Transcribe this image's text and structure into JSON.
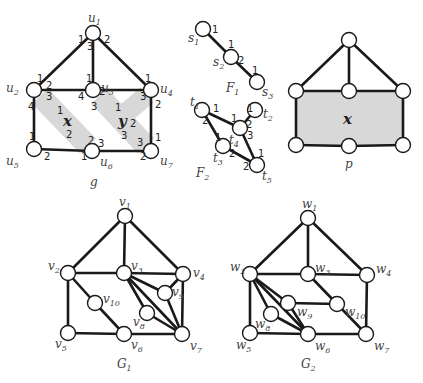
{
  "figure": {
    "graph_g": {
      "caption": "g",
      "nodes": [
        {
          "id": "u1",
          "label": "u",
          "sub": "1",
          "x": 93,
          "y": 33,
          "lx": 88,
          "ly": 22
        },
        {
          "id": "u2",
          "label": "u",
          "sub": "2",
          "x": 34,
          "y": 90,
          "lx": 6,
          "ly": 92
        },
        {
          "id": "u3",
          "label": "u",
          "sub": "3",
          "x": 93,
          "y": 90,
          "lx": 101,
          "ly": 92
        },
        {
          "id": "u4",
          "label": "u",
          "sub": "4",
          "x": 151,
          "y": 90,
          "lx": 160,
          "ly": 93
        },
        {
          "id": "u5",
          "label": "u",
          "sub": "5",
          "x": 34,
          "y": 149,
          "lx": 6,
          "ly": 165
        },
        {
          "id": "u6",
          "label": "u",
          "sub": "6",
          "x": 92,
          "y": 151,
          "lx": 100,
          "ly": 166
        },
        {
          "id": "u7",
          "label": "u",
          "sub": "7",
          "x": 151,
          "y": 151,
          "lx": 160,
          "ly": 165
        }
      ],
      "edges": [
        [
          "u1",
          "u2"
        ],
        [
          "u1",
          "u3"
        ],
        [
          "u1",
          "u4"
        ],
        [
          "u2",
          "u3"
        ],
        [
          "u3",
          "u4"
        ],
        [
          "u2",
          "u5"
        ],
        [
          "u4",
          "u7"
        ],
        [
          "u5",
          "u6"
        ],
        [
          "u6",
          "u7"
        ]
      ],
      "faces": [
        {
          "name": "x",
          "x": 63,
          "y": 126
        },
        {
          "name": "y",
          "x": 118,
          "y": 126
        }
      ],
      "ports": [
        {
          "t": "1",
          "x": 78,
          "y": 43
        },
        {
          "t": "2",
          "x": 104,
          "y": 43
        },
        {
          "t": "3",
          "x": 87,
          "y": 50
        },
        {
          "t": "1",
          "x": 37,
          "y": 82
        },
        {
          "t": "2",
          "x": 46,
          "y": 89
        },
        {
          "t": "3",
          "x": 46,
          "y": 100
        },
        {
          "t": "4",
          "x": 28,
          "y": 110
        },
        {
          "t": "1",
          "x": 86,
          "y": 82
        },
        {
          "t": "2",
          "x": 99,
          "y": 95
        },
        {
          "t": "4",
          "x": 78,
          "y": 100
        },
        {
          "t": "3",
          "x": 91,
          "y": 110
        },
        {
          "t": "1",
          "x": 145,
          "y": 82
        },
        {
          "t": "3",
          "x": 140,
          "y": 100
        },
        {
          "t": "2",
          "x": 155,
          "y": 108
        },
        {
          "t": "1",
          "x": 29,
          "y": 140
        },
        {
          "t": "2",
          "x": 44,
          "y": 160
        },
        {
          "t": "2",
          "x": 88,
          "y": 144
        },
        {
          "t": "3",
          "x": 98,
          "y": 147
        },
        {
          "t": "1",
          "x": 81,
          "y": 160
        },
        {
          "t": "1",
          "x": 155,
          "y": 141
        },
        {
          "t": "3",
          "x": 137,
          "y": 146
        },
        {
          "t": "2",
          "x": 140,
          "y": 160
        },
        {
          "t": "1",
          "x": 57,
          "y": 114
        },
        {
          "t": "2",
          "x": 66,
          "y": 138
        },
        {
          "t": "1",
          "x": 115,
          "y": 111
        },
        {
          "t": "2",
          "x": 130,
          "y": 127
        },
        {
          "t": "3",
          "x": 121,
          "y": 139
        }
      ]
    },
    "graph_F1": {
      "caption": "F",
      "caption_sub": "1",
      "nodes": [
        {
          "id": "s1",
          "label": "s",
          "sub": "1",
          "x": 203,
          "y": 29,
          "lx": 188,
          "ly": 42
        },
        {
          "id": "s2",
          "label": "s",
          "sub": "2",
          "x": 231,
          "y": 57,
          "lx": 213,
          "ly": 66
        },
        {
          "id": "s3",
          "label": "s",
          "sub": "3",
          "x": 257,
          "y": 82,
          "lx": 262,
          "ly": 96
        }
      ],
      "edges": [
        [
          "s1",
          "s2"
        ],
        [
          "s2",
          "s3"
        ]
      ],
      "ports": [
        {
          "t": "1",
          "x": 212,
          "y": 33
        },
        {
          "t": "1",
          "x": 228,
          "y": 48
        },
        {
          "t": "2",
          "x": 238,
          "y": 64
        },
        {
          "t": "1",
          "x": 252,
          "y": 74
        }
      ]
    },
    "graph_F2": {
      "caption": "F",
      "caption_sub": "2",
      "nodes": [
        {
          "id": "t1",
          "label": "t",
          "sub": "1",
          "x": 202,
          "y": 110,
          "lx": 190,
          "ly": 106
        },
        {
          "id": "t2",
          "label": "t",
          "sub": "2",
          "x": 255,
          "y": 110,
          "lx": 263,
          "ly": 118
        },
        {
          "id": "t4",
          "label": "t",
          "sub": "4",
          "x": 240,
          "y": 128,
          "lx": 229,
          "ly": 144
        },
        {
          "id": "t3",
          "label": "t",
          "sub": "3",
          "x": 223,
          "y": 146,
          "lx": 213,
          "ly": 162
        },
        {
          "id": "t5",
          "label": "t",
          "sub": "5",
          "x": 257,
          "y": 165,
          "lx": 262,
          "ly": 180
        }
      ],
      "edges": [
        [
          "t1",
          "t4"
        ],
        [
          "t1",
          "t3"
        ],
        [
          "t4",
          "t2"
        ],
        [
          "t4",
          "t5"
        ],
        [
          "t3",
          "t5"
        ]
      ],
      "ports": [
        {
          "t": "1",
          "x": 213,
          "y": 112
        },
        {
          "t": "2",
          "x": 202,
          "y": 124
        },
        {
          "t": "1",
          "x": 231,
          "y": 122
        },
        {
          "t": "2",
          "x": 246,
          "y": 128
        },
        {
          "t": "3",
          "x": 247,
          "y": 139
        },
        {
          "t": "1",
          "x": 247,
          "y": 112
        },
        {
          "t": "1",
          "x": 215,
          "y": 141
        },
        {
          "t": "2",
          "x": 229,
          "y": 157
        },
        {
          "t": "1",
          "x": 258,
          "y": 157
        },
        {
          "t": "2",
          "x": 243,
          "y": 170
        }
      ]
    },
    "graph_p": {
      "caption": "p",
      "nodes": [
        {
          "id": "p1",
          "x": 349,
          "y": 40
        },
        {
          "id": "p2",
          "x": 296,
          "y": 91
        },
        {
          "id": "p3",
          "x": 349,
          "y": 91
        },
        {
          "id": "p4",
          "x": 403,
          "y": 91
        },
        {
          "id": "p5",
          "x": 296,
          "y": 145
        },
        {
          "id": "p6",
          "x": 349,
          "y": 146
        },
        {
          "id": "p7",
          "x": 403,
          "y": 145
        }
      ],
      "edges": [
        [
          "p1",
          "p2"
        ],
        [
          "p1",
          "p3"
        ],
        [
          "p1",
          "p4"
        ],
        [
          "p2",
          "p3"
        ],
        [
          "p3",
          "p4"
        ],
        [
          "p2",
          "p5"
        ],
        [
          "p4",
          "p7"
        ],
        [
          "p5",
          "p6"
        ],
        [
          "p6",
          "p7"
        ]
      ],
      "face": {
        "name": "x",
        "x": 349,
        "y": 124
      }
    },
    "graph_G1": {
      "caption": "G",
      "caption_sub": "1",
      "nodes": [
        {
          "id": "v1",
          "label": "v",
          "sub": "1",
          "x": 125,
          "y": 216,
          "lx": 119,
          "ly": 206
        },
        {
          "id": "v2",
          "label": "v",
          "sub": "2",
          "x": 68,
          "y": 273,
          "lx": 48,
          "ly": 270
        },
        {
          "id": "v3",
          "label": "v",
          "sub": "3",
          "x": 124,
          "y": 273,
          "lx": 131,
          "ly": 270
        },
        {
          "id": "v4",
          "label": "v",
          "sub": "4",
          "x": 183,
          "y": 274,
          "lx": 193,
          "ly": 277
        },
        {
          "id": "v5",
          "label": "v",
          "sub": "5",
          "x": 68,
          "y": 333,
          "lx": 55,
          "ly": 348
        },
        {
          "id": "v6",
          "label": "v",
          "sub": "6",
          "x": 124,
          "y": 334,
          "lx": 131,
          "ly": 349
        },
        {
          "id": "v7",
          "label": "v",
          "sub": "7",
          "x": 182,
          "y": 334,
          "lx": 190,
          "ly": 350
        },
        {
          "id": "v8",
          "label": "v",
          "sub": "8",
          "x": 147,
          "y": 313,
          "lx": 133,
          "ly": 326
        },
        {
          "id": "v9",
          "label": "v",
          "sub": "9",
          "x": 165,
          "y": 293,
          "lx": 172,
          "ly": 296
        },
        {
          "id": "v10",
          "label": "v",
          "sub": "10",
          "x": 95,
          "y": 303,
          "lx": 103,
          "ly": 303
        }
      ],
      "edges": [
        [
          "v1",
          "v2"
        ],
        [
          "v1",
          "v3"
        ],
        [
          "v1",
          "v4"
        ],
        [
          "v2",
          "v3"
        ],
        [
          "v3",
          "v4"
        ],
        [
          "v2",
          "v5"
        ],
        [
          "v2",
          "v10"
        ],
        [
          "v10",
          "v6"
        ],
        [
          "v5",
          "v6"
        ],
        [
          "v6",
          "v7"
        ],
        [
          "v4",
          "v7"
        ],
        [
          "v3",
          "v9"
        ],
        [
          "v3",
          "v8"
        ],
        [
          "v4",
          "v9"
        ],
        [
          "v9",
          "v7"
        ],
        [
          "v8",
          "v7"
        ],
        [
          "v3",
          "v7"
        ]
      ]
    },
    "graph_G2": {
      "caption": "G",
      "caption_sub": "2",
      "nodes": [
        {
          "id": "w1",
          "label": "w",
          "sub": "1",
          "x": 308,
          "y": 218,
          "lx": 302,
          "ly": 208
        },
        {
          "id": "w2",
          "label": "w",
          "sub": "2",
          "x": 250,
          "y": 274,
          "lx": 230,
          "ly": 271
        },
        {
          "id": "w3",
          "label": "w",
          "sub": "3",
          "x": 308,
          "y": 274,
          "lx": 315,
          "ly": 272
        },
        {
          "id": "w4",
          "label": "w",
          "sub": "4",
          "x": 367,
          "y": 275,
          "lx": 376,
          "ly": 273
        },
        {
          "id": "w5",
          "label": "w",
          "sub": "5",
          "x": 250,
          "y": 333,
          "lx": 236,
          "ly": 349
        },
        {
          "id": "w6",
          "label": "w",
          "sub": "6",
          "x": 308,
          "y": 334,
          "lx": 315,
          "ly": 350
        },
        {
          "id": "w7",
          "label": "w",
          "sub": "7",
          "x": 366,
          "y": 334,
          "lx": 374,
          "ly": 350
        },
        {
          "id": "w8",
          "label": "w",
          "sub": "8",
          "x": 271,
          "y": 314,
          "lx": 255,
          "ly": 328
        },
        {
          "id": "w9",
          "label": "w",
          "sub": "9",
          "x": 288,
          "y": 303,
          "lx": 297,
          "ly": 316
        },
        {
          "id": "w10",
          "label": "w",
          "sub": "10",
          "x": 337,
          "y": 304,
          "lx": 345,
          "ly": 316
        }
      ],
      "edges": [
        [
          "w1",
          "w2"
        ],
        [
          "w1",
          "w3"
        ],
        [
          "w1",
          "w4"
        ],
        [
          "w2",
          "w3"
        ],
        [
          "w3",
          "w4"
        ],
        [
          "w2",
          "w5"
        ],
        [
          "w4",
          "w7"
        ],
        [
          "w5",
          "w6"
        ],
        [
          "w6",
          "w7"
        ],
        [
          "w3",
          "w10"
        ],
        [
          "w10",
          "w7"
        ],
        [
          "w9",
          "w10"
        ],
        [
          "w2",
          "w9"
        ],
        [
          "w2",
          "w8"
        ],
        [
          "w2",
          "w6"
        ],
        [
          "w9",
          "w6"
        ],
        [
          "w8",
          "w6"
        ]
      ]
    },
    "colors": {
      "stroke": "#1a1a1a",
      "shade": "#d8d8d8",
      "node_fill": "#ffffff",
      "label": "#444444"
    }
  }
}
